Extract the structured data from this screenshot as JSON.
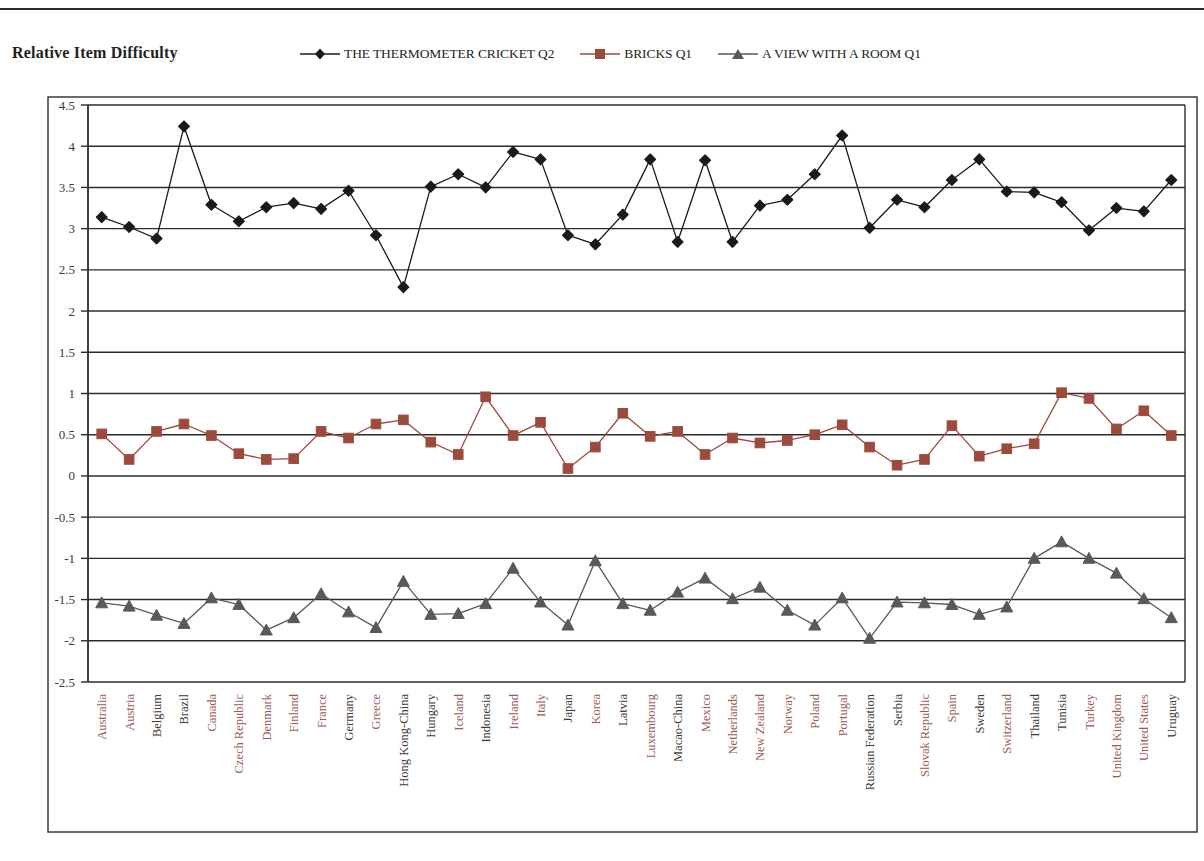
{
  "page": {
    "axis_title": "Relative Item Difficulty"
  },
  "legend": {
    "position": "top",
    "items": [
      {
        "label": "THE THERMOMETER CRICKET Q2",
        "color": "#1a1a1a",
        "marker": "diamond"
      },
      {
        "label": "BRICKS Q1",
        "color": "#9c4a3c",
        "marker": "square"
      },
      {
        "label": "A VIEW WITH A ROOM Q1",
        "color": "#595959",
        "marker": "triangle"
      }
    ]
  },
  "chart_data": {
    "type": "line",
    "title": "Relative Item Difficulty",
    "xlabel": "",
    "ylabel": "Relative Item Difficulty",
    "ylim": [
      -2.5,
      4.5
    ],
    "ytick_step": 0.5,
    "grid": true,
    "ytick_labels": [
      "4.5",
      "4",
      "3.5",
      "3",
      "2.5",
      "2",
      "1.5",
      "1",
      "0.5",
      "0",
      "-0.5",
      "-1",
      "-1.5",
      "-2",
      "-2.5"
    ],
    "categories": [
      "Australia",
      "Austria",
      "Belgium",
      "Brazil",
      "Canada",
      "Czech Republic",
      "Denmark",
      "Finland",
      "France",
      "Germany",
      "Greece",
      "Hong Kong-China",
      "Hungary",
      "Iceland",
      "Indonesia",
      "Ireland",
      "Italy",
      "Japan",
      "Korea",
      "Latvia",
      "Luxembourg",
      "Macao-China",
      "Mexico",
      "Netherlands",
      "New Zealand",
      "Norway",
      "Poland",
      "Portugal",
      "Russian Federation",
      "Serbia",
      "Slovak Republic",
      "Spain",
      "Sweden",
      "Switzerland",
      "Thailand",
      "Tunisia",
      "Turkey",
      "United Kingdom",
      "United States",
      "Uruguay"
    ],
    "category_label_colors": [
      "red",
      "red",
      "dark",
      "dark",
      "red",
      "red",
      "red",
      "red",
      "red",
      "dark",
      "red",
      "dark",
      "dark",
      "red",
      "dark",
      "red",
      "red",
      "dark",
      "red",
      "dark",
      "red",
      "dark",
      "red",
      "red",
      "red",
      "red",
      "red",
      "red",
      "dark",
      "dark",
      "red",
      "red",
      "dark",
      "red",
      "dark",
      "dark",
      "red",
      "red",
      "red",
      "dark"
    ],
    "series": [
      {
        "name": "THE THERMOMETER CRICKET Q2",
        "color": "#1a1a1a",
        "marker": "diamond",
        "values": [
          3.14,
          3.02,
          2.88,
          4.24,
          3.29,
          3.09,
          3.26,
          3.31,
          3.24,
          3.46,
          2.92,
          2.29,
          3.51,
          3.66,
          3.5,
          3.93,
          3.84,
          2.92,
          2.81,
          3.17,
          3.84,
          2.84,
          3.83,
          2.84,
          3.28,
          3.35,
          3.66,
          4.13,
          3.01,
          3.35,
          3.26,
          3.59,
          3.84,
          3.45,
          3.44,
          3.32,
          2.98,
          3.25,
          3.21,
          3.59
        ]
      },
      {
        "name": "BRICKS Q1",
        "color": "#9c4a3c",
        "marker": "square",
        "values": [
          0.51,
          0.2,
          0.54,
          0.63,
          0.49,
          0.27,
          0.2,
          0.21,
          0.54,
          0.46,
          0.63,
          0.68,
          0.41,
          0.26,
          0.96,
          0.49,
          0.65,
          0.09,
          0.35,
          0.76,
          0.48,
          0.54,
          0.26,
          0.46,
          0.4,
          0.43,
          0.5,
          0.62,
          0.35,
          0.13,
          0.2,
          0.61,
          0.24,
          0.33,
          0.39,
          1.01,
          0.94,
          0.57,
          0.79,
          0.49
        ]
      },
      {
        "name": "A VIEW WITH A ROOM Q1",
        "color": "#595959",
        "marker": "triangle",
        "values": [
          -1.54,
          -1.58,
          -1.69,
          -1.79,
          -1.48,
          -1.56,
          -1.87,
          -1.72,
          -1.43,
          -1.65,
          -1.84,
          -1.28,
          -1.68,
          -1.67,
          -1.55,
          -1.12,
          -1.53,
          -1.81,
          -1.03,
          -1.55,
          -1.63,
          -1.41,
          -1.24,
          -1.49,
          -1.35,
          -1.63,
          -1.81,
          -1.48,
          -1.97,
          -1.53,
          -1.54,
          -1.56,
          -1.68,
          -1.59,
          -1.0,
          -0.8,
          -1.0,
          -1.18,
          -1.49,
          -1.72
        ]
      }
    ]
  }
}
